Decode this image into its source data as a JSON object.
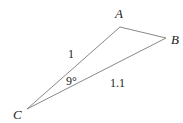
{
  "diagram": {
    "type": "triangle",
    "vertices": {
      "A": {
        "label": "A",
        "x": 120,
        "y": 27,
        "label_x": 115,
        "label_y": 18
      },
      "B": {
        "label": "B",
        "x": 166,
        "y": 38,
        "label_x": 171,
        "label_y": 44
      },
      "C": {
        "label": "C",
        "x": 27,
        "y": 109,
        "label_x": 13,
        "label_y": 119
      }
    },
    "edges": [
      {
        "from": "A",
        "to": "B"
      },
      {
        "from": "A",
        "to": "C"
      },
      {
        "from": "B",
        "to": "C"
      }
    ],
    "measurements": {
      "side_CA": {
        "text": "1",
        "x": 68,
        "y": 58
      },
      "side_CB": {
        "text": "1.1",
        "x": 110,
        "y": 87
      },
      "angle_C": {
        "text": "9°",
        "x": 66,
        "y": 85
      }
    },
    "colors": {
      "edge": "#888888",
      "text": "#222222",
      "background": "#ffffff"
    }
  }
}
